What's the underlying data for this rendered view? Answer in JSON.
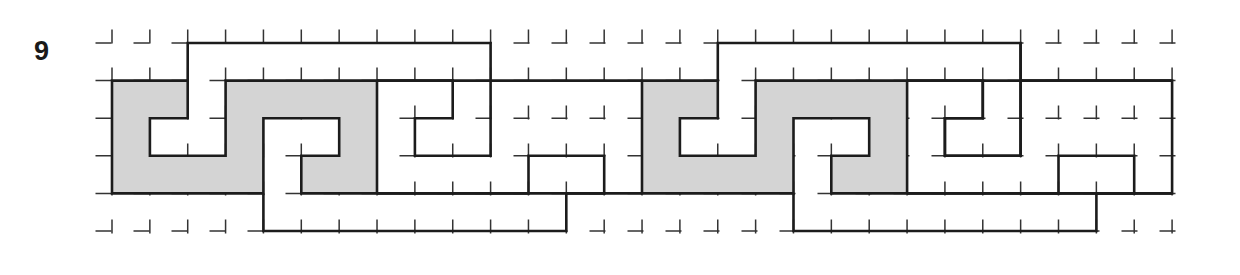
{
  "figure": {
    "label": "9",
    "colors": {
      "line": "#1c1c1c",
      "grid": "#333333",
      "shade": "#d4d4d4",
      "background": "#ffffff"
    },
    "grid": {
      "origin_x": 112,
      "origin_y": 43,
      "step_x": 37.86,
      "step_y": 37.6,
      "cols": 29,
      "rows": 6
    },
    "motif_repeat_cols": 14,
    "motif": {
      "shaded": [
        [
          0,
          1
        ],
        [
          2,
          1
        ],
        [
          2,
          2
        ],
        [
          1,
          2
        ],
        [
          1,
          3
        ],
        [
          3,
          3
        ],
        [
          3,
          1
        ],
        [
          7,
          1
        ],
        [
          7,
          4
        ],
        [
          5,
          4
        ],
        [
          5,
          3
        ],
        [
          6,
          3
        ],
        [
          6,
          2
        ],
        [
          4,
          2
        ],
        [
          4,
          4
        ],
        [
          0,
          4
        ]
      ],
      "lines": [
        [
          [
            2,
            1
          ],
          [
            2,
            0
          ],
          [
            10,
            0
          ],
          [
            10,
            1
          ]
        ],
        [
          [
            7,
            1
          ],
          [
            14,
            1
          ]
        ],
        [
          [
            7,
            1
          ],
          [
            9,
            1
          ],
          [
            9,
            2
          ],
          [
            8,
            2
          ],
          [
            8,
            3
          ],
          [
            10,
            3
          ],
          [
            10,
            1
          ]
        ],
        [
          [
            4,
            4
          ],
          [
            4,
            5
          ],
          [
            12,
            5
          ],
          [
            12,
            4
          ],
          [
            13,
            4
          ],
          [
            13,
            3
          ],
          [
            11,
            3
          ],
          [
            11,
            4
          ],
          [
            7,
            4
          ]
        ],
        [
          [
            7,
            4
          ],
          [
            14,
            4
          ]
        ]
      ]
    }
  }
}
